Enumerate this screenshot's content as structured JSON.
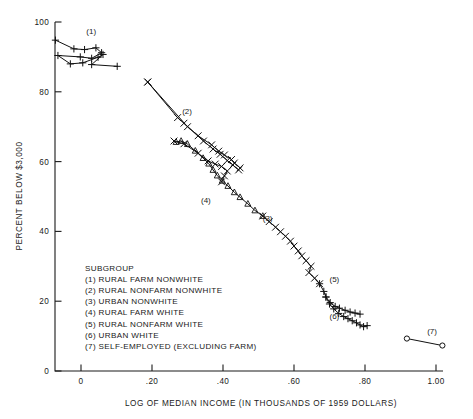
{
  "chart_data": {
    "type": "scatter",
    "title": "",
    "xlabel": "LOG OF MEDIAN INCOME (IN THOUSANDS OF 1959 DOLLARS)",
    "ylabel": "PERCENT BELOW $3,000",
    "xlim": [
      -0.1,
      1.05
    ],
    "ylim": [
      0,
      100
    ],
    "grid": false,
    "legend_position": "inside-lower-left",
    "xticks": [
      {
        "value": 0,
        "label": "0"
      },
      {
        "value": 0.2,
        "label": ".20"
      },
      {
        "value": 0.4,
        "label": ".40"
      },
      {
        "value": 0.6,
        "label": ".60"
      },
      {
        "value": 0.8,
        "label": ".80"
      },
      {
        "value": 1.0,
        "label": "1.00"
      }
    ],
    "yticks": [
      {
        "value": 0,
        "label": "0"
      },
      {
        "value": 20,
        "label": "20"
      },
      {
        "value": 40,
        "label": "40"
      },
      {
        "value": 60,
        "label": "60"
      },
      {
        "value": 80,
        "label": "80"
      },
      {
        "value": 100,
        "label": "100"
      }
    ],
    "legend_title": "SUBGROUP",
    "legend_entries": [
      "(1) RURAL FARM NONWHITE",
      "(2) RURAL NONFARM NONWHITE",
      "(3) URBAN NONWHITE",
      "(4) RURAL FARM WHITE",
      "(5) RURAL NONFARM WHITE",
      "(6) URBAN WHITE",
      "(7) SELF-EMPLOYED (EXCLUDING FARM)"
    ],
    "series": [
      {
        "name": "(1) RURAL FARM NONWHITE",
        "key": "s1",
        "marker": "plus",
        "label": "(1)",
        "label_xy": [
          0.015,
          96.5
        ],
        "points": [
          [
            -0.072,
            94.8
          ],
          [
            -0.02,
            92.3
          ],
          [
            0.01,
            92.1
          ],
          [
            0.042,
            92.6
          ],
          [
            0.058,
            91.2
          ],
          [
            0.03,
            89.6
          ],
          [
            -0.002,
            90.0
          ],
          [
            -0.065,
            90.4
          ],
          [
            -0.03,
            88.0
          ],
          [
            0.005,
            88.3
          ],
          [
            0.048,
            89.9
          ],
          [
            0.062,
            90.7
          ],
          [
            0.03,
            87.8
          ],
          [
            0.102,
            87.3
          ]
        ]
      },
      {
        "name": "(2) RURAL NONFARM NONWHITE",
        "key": "s2",
        "marker": "cross",
        "label": "(2)",
        "label_xy": [
          0.285,
          73.7
        ],
        "points": [
          [
            0.188,
            82.8
          ],
          [
            0.272,
            72.6
          ],
          [
            0.29,
            71.0
          ],
          [
            0.33,
            67.4
          ],
          [
            0.368,
            64.8
          ],
          [
            0.388,
            63.0
          ],
          [
            0.404,
            61.9
          ],
          [
            0.424,
            60.6
          ],
          [
            0.432,
            59.6
          ],
          [
            0.448,
            58.2
          ]
        ]
      },
      {
        "name": "(2b) RURAL NONFARM NONWHITE (second path)",
        "key": "s2b",
        "marker": "cross",
        "label": "",
        "label_xy": [
          0,
          0
        ],
        "points": [
          [
            0.188,
            82.8
          ],
          [
            0.3,
            70.0
          ],
          [
            0.345,
            65.9
          ],
          [
            0.372,
            63.6
          ],
          [
            0.392,
            62.1
          ],
          [
            0.412,
            60.3
          ],
          [
            0.428,
            59.0
          ],
          [
            0.444,
            57.6
          ]
        ]
      },
      {
        "name": "(4) RURAL FARM WHITE",
        "key": "s4",
        "marker": "triangle",
        "label": "(4)",
        "label_xy": [
          0.338,
          48.0
        ],
        "points": [
          [
            0.268,
            65.6
          ],
          [
            0.282,
            65.9
          ],
          [
            0.3,
            65.0
          ],
          [
            0.322,
            63.1
          ],
          [
            0.344,
            61.0
          ],
          [
            0.36,
            59.4
          ],
          [
            0.372,
            57.6
          ],
          [
            0.384,
            56.0
          ],
          [
            0.398,
            54.5
          ],
          [
            0.414,
            53.0
          ],
          [
            0.432,
            51.2
          ],
          [
            0.448,
            49.8
          ],
          [
            0.47,
            47.9
          ],
          [
            0.49,
            46.0
          ],
          [
            0.512,
            44.4
          ]
        ]
      },
      {
        "name": "(4b) RURAL FARM WHITE (upper path)",
        "key": "s4b",
        "marker": "cross",
        "label": "",
        "label_xy": [
          0,
          0
        ],
        "points": [
          [
            0.262,
            65.9
          ],
          [
            0.29,
            65.1
          ],
          [
            0.33,
            62.4
          ],
          [
            0.358,
            60.2
          ],
          [
            0.378,
            59.3
          ],
          [
            0.396,
            58.6
          ],
          [
            0.412,
            57.3
          ],
          [
            0.404,
            55.9
          ],
          [
            0.396,
            54.2
          ]
        ]
      },
      {
        "name": "(3) URBAN NONWHITE",
        "key": "s3",
        "marker": "cross",
        "label": "(3)",
        "label_xy": [
          0.512,
          43.0
        ],
        "points": [
          [
            0.512,
            44.4
          ],
          [
            0.53,
            42.8
          ],
          [
            0.548,
            41.2
          ],
          [
            0.562,
            39.9
          ],
          [
            0.576,
            38.6
          ],
          [
            0.59,
            37.2
          ],
          [
            0.6,
            35.8
          ],
          [
            0.612,
            34.4
          ],
          [
            0.622,
            33.0
          ],
          [
            0.634,
            31.6
          ],
          [
            0.648,
            30.0
          ],
          [
            0.642,
            28.2
          ],
          [
            0.658,
            26.6
          ],
          [
            0.672,
            25.0
          ]
        ]
      },
      {
        "name": "(5) RURAL NONFARM WHITE",
        "key": "s5",
        "marker": "plus",
        "label": "(5)",
        "label_xy": [
          0.7,
          25.6
        ],
        "points": [
          [
            0.672,
            25.0
          ],
          [
            0.684,
            22.8
          ],
          [
            0.69,
            21.2
          ],
          [
            0.702,
            19.6
          ],
          [
            0.716,
            18.5
          ],
          [
            0.728,
            18.0
          ],
          [
            0.744,
            17.4
          ],
          [
            0.758,
            16.9
          ],
          [
            0.772,
            16.6
          ],
          [
            0.786,
            16.3
          ]
        ]
      },
      {
        "name": "(6) URBAN WHITE",
        "key": "s6",
        "marker": "plus",
        "label": "(6)",
        "label_xy": [
          0.7,
          15.0
        ],
        "points": [
          [
            0.69,
            21.2
          ],
          [
            0.7,
            19.2
          ],
          [
            0.712,
            17.8
          ],
          [
            0.726,
            16.5
          ],
          [
            0.74,
            15.6
          ],
          [
            0.752,
            15.0
          ],
          [
            0.764,
            14.4
          ],
          [
            0.776,
            13.8
          ],
          [
            0.786,
            13.2
          ],
          [
            0.796,
            12.7
          ],
          [
            0.806,
            13.0
          ]
        ]
      },
      {
        "name": "(7) SELF-EMPLOYED (EXCLUDING FARM)",
        "key": "s7",
        "marker": "circle",
        "label": "(7)",
        "label_xy": [
          0.975,
          10.6
        ],
        "points": [
          [
            0.918,
            9.3
          ],
          [
            1.018,
            7.3
          ]
        ]
      }
    ]
  }
}
